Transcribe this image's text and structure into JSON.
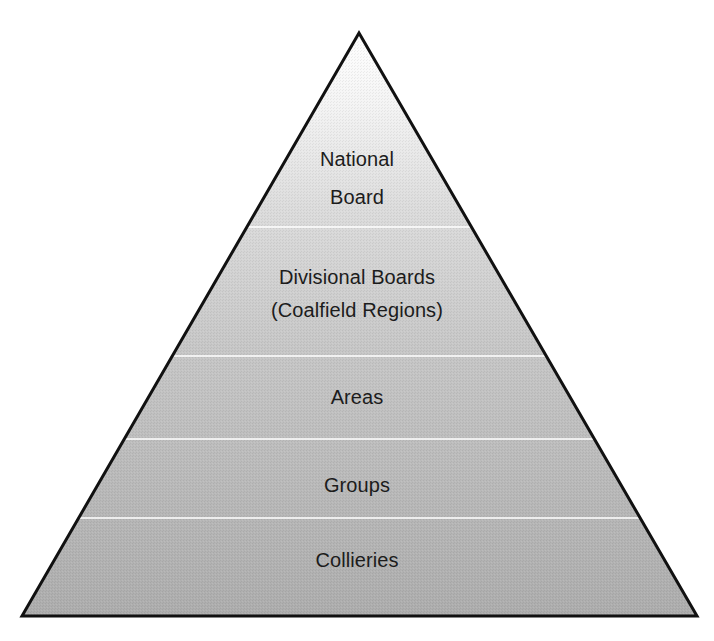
{
  "diagram": {
    "type": "hierarchy-pyramid",
    "colors": {
      "outline": "#111111",
      "divider": "#ffffff",
      "fill_top": "#f6f6f6",
      "fill_bottom": "#aeaeae",
      "text": "#1c1c1c"
    },
    "geometry": {
      "apex": [
        359,
        33
      ],
      "base_left": [
        22,
        616
      ],
      "base_right": [
        697,
        616
      ],
      "dividers_y": [
        227,
        356,
        439,
        518
      ]
    },
    "tiers": [
      {
        "level": 1,
        "lines": [
          "National",
          "Board"
        ]
      },
      {
        "level": 2,
        "lines": [
          "Divisional Boards",
          "(Coalfield Regions)"
        ]
      },
      {
        "level": 3,
        "lines": [
          "Areas"
        ]
      },
      {
        "level": 4,
        "lines": [
          "Groups"
        ]
      },
      {
        "level": 5,
        "lines": [
          "Collieries"
        ]
      }
    ]
  }
}
